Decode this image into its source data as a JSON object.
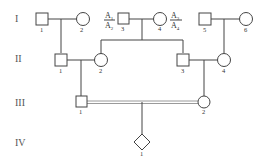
{
  "generations": [
    "I",
    "II",
    "III",
    "IV"
  ],
  "individuals": {
    "I1": {
      "label": "1",
      "sex": "male"
    },
    "I2": {
      "label": "2",
      "sex": "female"
    },
    "I3": {
      "label": "3",
      "sex": "male",
      "genotype_top": "A1",
      "genotype_bottom": "A2"
    },
    "I4": {
      "label": "4",
      "sex": "female",
      "genotype_top": "A3",
      "genotype_bottom": "A4"
    },
    "I5": {
      "label": "5",
      "sex": "male"
    },
    "I6": {
      "label": "6",
      "sex": "female"
    },
    "II1": {
      "label": "1",
      "sex": "male"
    },
    "II2": {
      "label": "2",
      "sex": "female"
    },
    "II3": {
      "label": "3",
      "sex": "male"
    },
    "II4": {
      "label": "4",
      "sex": "female"
    },
    "III1": {
      "label": "1",
      "sex": "male"
    },
    "III2": {
      "label": "2",
      "sex": "female"
    },
    "IV1": {
      "label": "1",
      "sex": "unknown"
    }
  },
  "allele_parts": {
    "A": "A",
    "sub1": "1",
    "sub2": "2",
    "sub3": "3",
    "sub4": "4"
  },
  "relationships": {
    "consanguineous_marriage": "III1-III2"
  },
  "colors": {
    "line": "#444444",
    "consanguinity_line": "#9a9a9a"
  }
}
